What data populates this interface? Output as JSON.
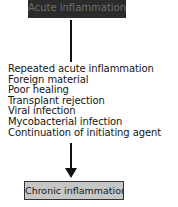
{
  "diagram": {
    "top_node": {
      "label": "Acute inflammation",
      "fill": "#2b2b2b",
      "text_color": "#6e6e6e"
    },
    "causes": [
      "Repeated acute inflammation",
      "Foreign material",
      "Poor healing",
      "Transplant rejection",
      "Viral infection",
      "Mycobacterial infection",
      "Continuation of initiating agent"
    ],
    "arrow": {
      "direction": "down"
    },
    "bottom_node": {
      "label": "Chronic inflammation",
      "fill": "#c6c6c6",
      "border": "#333333"
    }
  }
}
